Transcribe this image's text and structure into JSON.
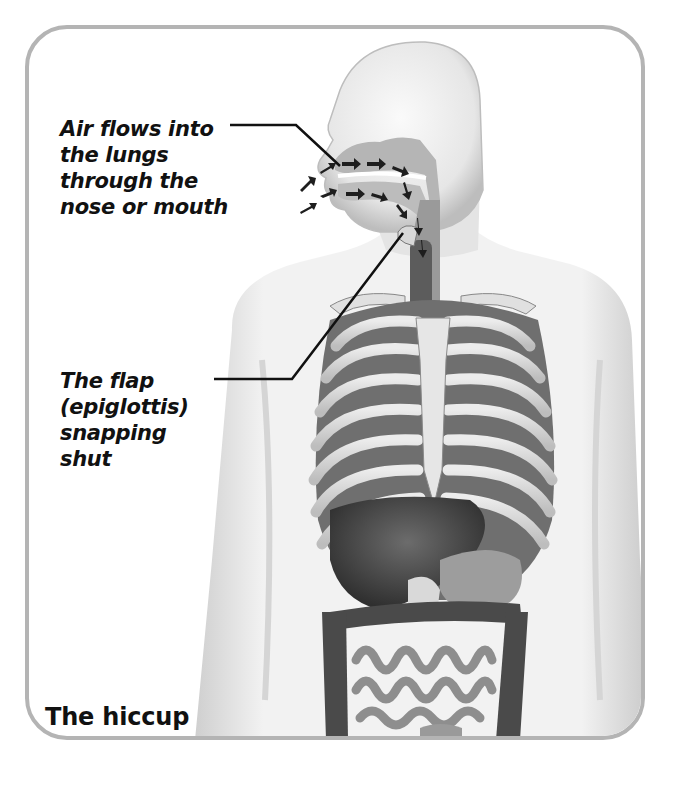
{
  "figure": {
    "title": "The hiccup",
    "border_color": "#b4b4b4"
  },
  "callouts": [
    {
      "id": "air-flow",
      "lines": [
        "Air flows into",
        "the lungs",
        "through the",
        "nose or mouth"
      ],
      "points_to": "nasal and oral airway"
    },
    {
      "id": "epiglottis",
      "lines": [
        "The flap",
        "(epiglottis)",
        "snapping",
        "shut"
      ],
      "points_to": "epiglottis at top of windpipe"
    }
  ],
  "caption": "The hiccup"
}
